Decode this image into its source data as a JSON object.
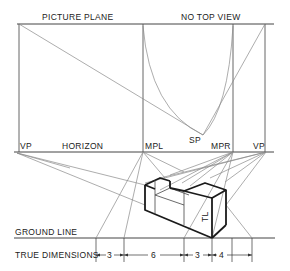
{
  "labels": {
    "picture_plane": "PICTURE PLANE",
    "no_top_view": "NO TOP VIEW",
    "vp_left": "VP",
    "horizon": "HORIZON",
    "mpl": "MPL",
    "sp": "SP",
    "mpr": "MPR",
    "vp_right": "VP",
    "ground_line": "GROUND LINE",
    "true_dimensions": "TRUE DIMENSIONS",
    "true_length": "TL"
  },
  "dimensions": {
    "d1": "3",
    "d2": "6",
    "d3": "3",
    "d4": "4"
  },
  "colors": {
    "line": "#8a8a8a",
    "object": "#1a1a1a",
    "text": "#222222",
    "background": "#ffffff"
  }
}
